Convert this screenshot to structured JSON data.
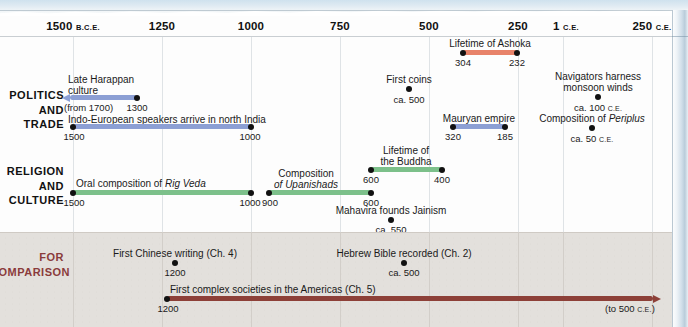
{
  "figure": {
    "type": "timeline",
    "orientation": "horizontal",
    "axis": {
      "ticks": [
        {
          "label": "1500",
          "era": "B.C.E.",
          "x": 73
        },
        {
          "label": "1250",
          "era": "",
          "x": 162
        },
        {
          "label": "1000",
          "era": "",
          "x": 251
        },
        {
          "label": "750",
          "era": "",
          "x": 340
        },
        {
          "label": "500",
          "era": "",
          "x": 429
        },
        {
          "label": "250",
          "era": "",
          "x": 518
        },
        {
          "label": "1",
          "era": "C.E.",
          "x": 563
        },
        {
          "label": "250",
          "era": "C.E.",
          "x": 652
        }
      ]
    },
    "colors": {
      "politics_bar": "#8c9fd4",
      "religion_bar": "#7cc08a",
      "ashoka_bar": "#e8836a",
      "comparison_bar": "#8d4038",
      "comparison_label": "#8a3b3b",
      "comparison_band": "#e3e0dc",
      "dot": "#111111",
      "gridline": "#dfe3e6"
    },
    "rows": [
      {
        "name": "politics-and-trade",
        "label_lines": [
          "POLITICS",
          "AND",
          "TRADE"
        ],
        "events": [
          {
            "id": "late-harappan-culture",
            "kind": "bar",
            "label_lines": [
              "Late Harappan",
              "culture"
            ],
            "start_label": "(from 1700)",
            "end_label": "1300",
            "arrow": "left"
          },
          {
            "id": "indo-european-speakers",
            "kind": "bar",
            "label_lines": [
              "Indo-European speakers arrive in north India"
            ],
            "start_label": "1500",
            "end_label": "1000",
            "arrow": "none"
          },
          {
            "id": "first-coins",
            "kind": "point",
            "label_lines": [
              "First coins"
            ],
            "date_label": "ca. 500",
            "date_era": ""
          },
          {
            "id": "mauryan-empire",
            "kind": "bar",
            "label_lines": [
              "Mauryan empire"
            ],
            "start_label": "320",
            "end_label": "185",
            "arrow": "none"
          },
          {
            "id": "navigators-monsoon-winds",
            "kind": "point",
            "label_lines": [
              "Navigators harness",
              "monsoon winds"
            ],
            "date_label": "ca. 100",
            "date_era": "C.E."
          },
          {
            "id": "composition-of-periplus",
            "kind": "point",
            "label_lines": [
              "Composition of ",
              "Periplus"
            ],
            "date_label": "ca. 50",
            "date_era": "C.E."
          }
        ]
      },
      {
        "name": "religion-and-culture",
        "label_lines": [
          "RELIGION",
          "AND",
          "CULTURE"
        ],
        "events": [
          {
            "id": "oral-composition-rig-veda",
            "kind": "bar",
            "label_lines": [
              "Oral composition of ",
              "Rig Veda"
            ],
            "start_label": "1500",
            "end_label": "1000",
            "arrow": "none"
          },
          {
            "id": "composition-of-upanishads",
            "kind": "bar",
            "label_lines": [
              "Composition",
              "of Upanishads"
            ],
            "start_label": "900",
            "end_label": "600",
            "arrow": "none"
          },
          {
            "id": "lifetime-of-the-buddha",
            "kind": "bar",
            "label_lines": [
              "Lifetime of",
              "the Buddha"
            ],
            "start_label": "600",
            "end_label": "400",
            "arrow": "none"
          },
          {
            "id": "mahavira-founds-jainism",
            "kind": "point",
            "label_lines": [
              "Mahavira founds Jainism"
            ],
            "date_label": "ca. 550",
            "date_era": ""
          }
        ]
      },
      {
        "name": "for-comparison",
        "label_lines": [
          "FOR",
          "COMPARISON"
        ],
        "events": [
          {
            "id": "first-chinese-writing",
            "kind": "point",
            "label_lines": [
              "First Chinese writing (Ch. 4)"
            ],
            "date_label": "1200",
            "date_era": ""
          },
          {
            "id": "hebrew-bible-recorded",
            "kind": "point",
            "label_lines": [
              "Hebrew Bible recorded (Ch. 2)"
            ],
            "date_label": "ca. 500",
            "date_era": ""
          },
          {
            "id": "first-complex-societies-americas",
            "kind": "bar",
            "label_lines": [
              "First complex societies in the Americas (Ch. 5)"
            ],
            "start_label": "1200",
            "end_label": "(to 500 ",
            "end_era": "C.E.",
            "end_close": ")",
            "arrow": "right"
          }
        ]
      }
    ],
    "top_event": {
      "id": "lifetime-of-ashoka",
      "label": "Lifetime of Ashoka",
      "start_label": "304",
      "end_label": "232"
    }
  }
}
